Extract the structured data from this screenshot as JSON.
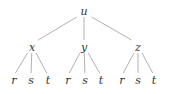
{
  "diagram": {
    "type": "tree",
    "edge_color": "#a8a8a8",
    "label_color": "#333333",
    "root": {
      "label": "u",
      "x": 84,
      "y": 11
    },
    "children": [
      {
        "label": "x",
        "x": 32,
        "y": 47,
        "children": [
          {
            "label": "r",
            "x": 14,
            "y": 80
          },
          {
            "label": "s",
            "x": 31,
            "y": 80
          },
          {
            "label": "t",
            "x": 48,
            "y": 80
          }
        ]
      },
      {
        "label": "y",
        "x": 84,
        "y": 47,
        "children": [
          {
            "label": "r",
            "x": 68,
            "y": 80
          },
          {
            "label": "s",
            "x": 85,
            "y": 80
          },
          {
            "label": "t",
            "x": 101,
            "y": 80
          }
        ]
      },
      {
        "label": "z",
        "x": 138,
        "y": 47,
        "children": [
          {
            "label": "r",
            "x": 122,
            "y": 80
          },
          {
            "label": "s",
            "x": 138,
            "y": 80
          },
          {
            "label": "t",
            "x": 154,
            "y": 80
          }
        ]
      }
    ]
  }
}
